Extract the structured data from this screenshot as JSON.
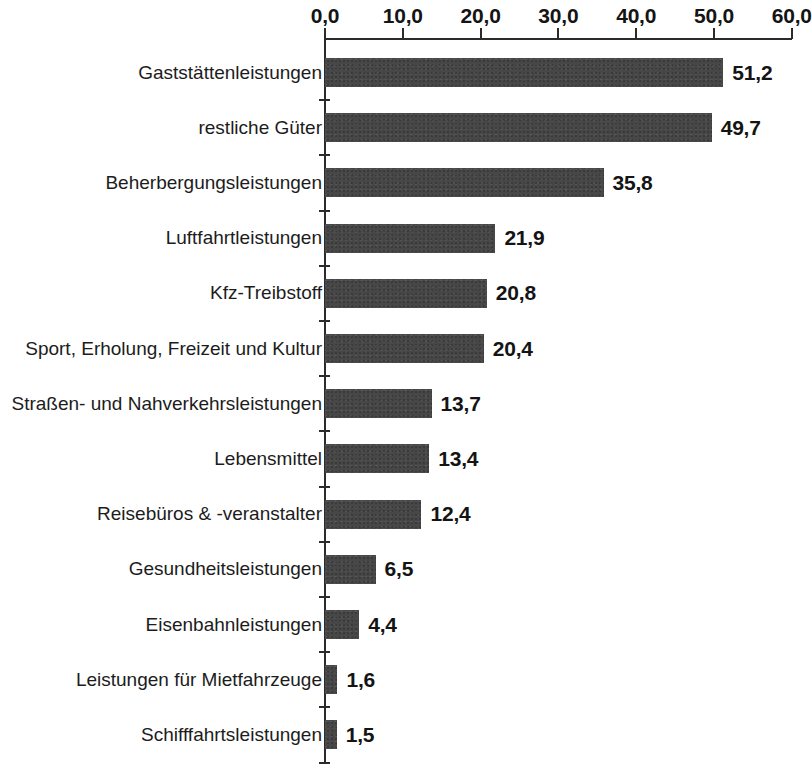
{
  "chart_data": {
    "type": "bar",
    "orientation": "horizontal",
    "title": "",
    "subtitle": "",
    "xlabel": "",
    "ylabel": "",
    "xlim": [
      0,
      60
    ],
    "xtick_step": 10,
    "grid": false,
    "legend": null,
    "axis_position": "top",
    "decimal_separator": ",",
    "bar_color": "#474747",
    "axis_color": "#2b2b2b",
    "text_color": "#141414",
    "background_color": "#ffffff",
    "tick_labels": [
      "0,0",
      "10,0",
      "20,0",
      "30,0",
      "40,0",
      "50,0",
      "60,0"
    ],
    "tick_values": [
      0,
      10,
      20,
      30,
      40,
      50,
      60
    ],
    "categories": [
      "Gaststättenleistungen",
      "restliche Güter",
      "Beherbergungsleistungen",
      "Luftfahrtleistungen",
      "Kfz-Treibstoff",
      "Sport, Erholung, Freizeit und Kultur",
      "Straßen- und Nahverkehrsleistungen",
      "Lebensmittel",
      "Reisebüros & -veranstalter",
      "Gesundheitsleistungen",
      "Eisenbahnleistungen",
      "Leistungen für Mietfahrzeuge",
      "Schifffahrtsleistungen"
    ],
    "values": [
      51.2,
      49.7,
      35.8,
      21.9,
      20.8,
      20.4,
      13.7,
      13.4,
      12.4,
      6.5,
      4.4,
      1.6,
      1.5
    ],
    "value_labels": [
      "51,2",
      "49,7",
      "35,8",
      "21,9",
      "20,8",
      "20,4",
      "13,7",
      "13,4",
      "12,4",
      "6,5",
      "4,4",
      "1,6",
      "1,5"
    ]
  }
}
